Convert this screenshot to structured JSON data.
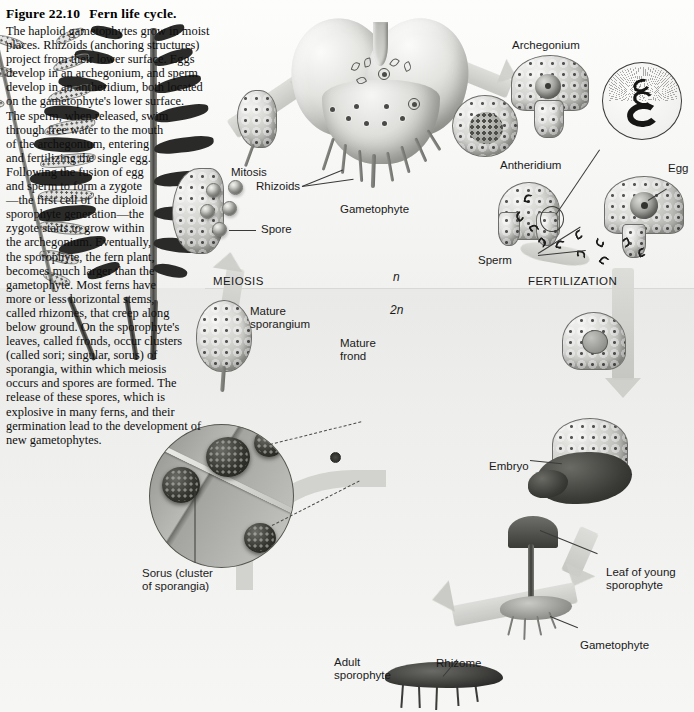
{
  "figure": {
    "number": "Figure 22.10",
    "title": "Fern life cycle.",
    "caption": "The haploid gametophytes grow in moist places. Rhizoids (anchoring structures) project from their lower surface. Eggs develop in an archegonium, and sperm develop in an antheridium, both located on the gametophyte's lower surface. The sperm, when released, swim through free water to the mouth of the archegonium, entering and fertilizing the single egg. Following the fusion of egg and sperm to form a zygote—the first cell of the diploid sporophyte generation—the zygote starts to grow within the archegonium. Eventually, the sporophyte, the fern plant, becomes much larger than the gametophyte. Most ferns have more or less horizontal stems, called rhizomes, that creep along below ground. On the sporophyte's leaves, called fronds, occur clusters (called sori; singular, sorus) of sporangia, within which meiosis occurs and spores are formed. The release of these spores, which is explosive in many ferns, and their germination lead to the development of new gametophytes."
  },
  "labels": {
    "mitosis": "Mitosis",
    "spore": "Spore",
    "rhizoids": "Rhizoids",
    "gametophyte_top": "Gametophyte",
    "archegonium": "Archegonium",
    "antheridium": "Antheridium",
    "egg": "Egg",
    "sperm": "Sperm",
    "fertilization": "FERTILIZATION",
    "meiosis": "MEIOSIS",
    "mature_sporangium": "Mature\nsporangium",
    "mature_frond": "Mature\nfrond",
    "sorus": "Sorus (cluster\nof sporangia)",
    "embryo": "Embryo",
    "leaf_young_sporophyte": "Leaf of young\nsporophyte",
    "gametophyte_bottom": "Gametophyte",
    "adult_sporophyte": "Adult\nsporophyte",
    "rhizome": "Rhizome"
  },
  "ploidy": {
    "haploid": "n",
    "diploid": "2n"
  },
  "colors": {
    "page_background": "#fdfdfc",
    "haploid_band": "#f5f5f4",
    "diploid_band": "#eaeae8",
    "ink": "#1a1a1a",
    "artwork_dark": "#2a2a28",
    "artwork_mid": "#8a8a86",
    "artwork_light": "#dcdcd9"
  }
}
